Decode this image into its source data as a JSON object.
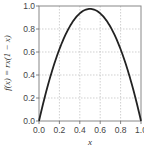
{
  "chart_data": {
    "type": "line",
    "title": "",
    "xlabel": "x",
    "ylabel": "f(x) = rx(1 − x)",
    "xlim": [
      0.0,
      1.0
    ],
    "ylim": [
      0.0,
      1.0
    ],
    "xticks": [
      "0.0",
      "0.2",
      "0.4",
      "0.6",
      "0.8",
      "1.0"
    ],
    "yticks": [
      "0.0",
      "0.2",
      "0.4",
      "0.6",
      "0.8",
      "1.0"
    ],
    "grid": true,
    "r": 3.9,
    "series": [
      {
        "name": "f(x)",
        "color": "#222222",
        "x": [
          0.0,
          0.1,
          0.2,
          0.3,
          0.4,
          0.5,
          0.6,
          0.7,
          0.8,
          0.9,
          1.0
        ],
        "values": [
          0.0,
          0.351,
          0.624,
          0.819,
          0.936,
          0.975,
          0.936,
          0.819,
          0.624,
          0.351,
          0.0
        ]
      }
    ]
  }
}
